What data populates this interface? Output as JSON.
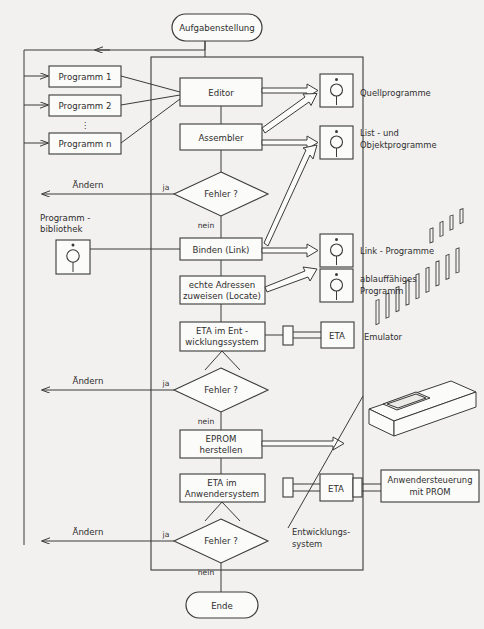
{
  "diagram": {
    "title": "Aufgabenstellung",
    "end_label": "Ende",
    "container_label_line1": "Entwicklungs-",
    "container_label_line2": "system",
    "colors": {
      "line": "#3a3a3a",
      "box_fill": "#fbfbf9",
      "background": "#f2f1ef"
    }
  },
  "programs": {
    "items": [
      {
        "label": "Programm 1"
      },
      {
        "label": "Programm 2"
      },
      {
        "label": "Programm n"
      }
    ],
    "ellipsis": "⋮"
  },
  "library": {
    "label_line1": "Programm -",
    "label_line2": "bibliothek",
    "icon": "tape-reel-icon"
  },
  "process": {
    "editor": "Editor",
    "assembler": "Assembler",
    "link": "Binden (Link)",
    "locate_line1": "echte Adressen",
    "locate_line2": "zuweisen (Locate)",
    "eta_dev_line1": "ETA im Ent -",
    "eta_dev_line2": "wicklungssystem",
    "eprom_line1": "EPROM",
    "eprom_line2": "herstellen",
    "eta_user_line1": "ETA im",
    "eta_user_line2": "Anwendersystem"
  },
  "decisions": [
    {
      "question": "Fehler ?",
      "yes": "ja",
      "no": "nein",
      "loop": "Ändern"
    },
    {
      "question": "Fehler ?",
      "yes": "ja",
      "no": "nein",
      "loop": "Ändern"
    },
    {
      "question": "Fehler ?",
      "yes": "ja",
      "no": "nein",
      "loop": "Ändern"
    }
  ],
  "outputs": [
    {
      "icon": "tape-reel-icon",
      "label_line1": "Quellprogramme",
      "label_line2": ""
    },
    {
      "icon": "tape-reel-icon",
      "label_line1": "List - und",
      "label_line2": "Objektprogramme"
    },
    {
      "icon": "tape-reel-icon",
      "label_line1": "Link - Programme",
      "label_line2": ""
    },
    {
      "icon": "tape-reel-icon",
      "label_line1": "ablauffähiges",
      "label_line2": "Programm"
    }
  ],
  "peripherals": {
    "eta_emulator_box": "ETA",
    "eta_emulator_label": "Emulator",
    "eta_user_box": "ETA",
    "anwender_line1": "Anwendersteuerung",
    "anwender_line2": "mit PROM",
    "eprom_chip_icon": "eprom-dip-chip-icon"
  }
}
